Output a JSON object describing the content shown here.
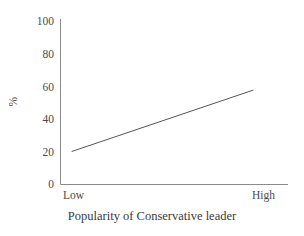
{
  "chart_data": {
    "type": "line",
    "title": "",
    "subtitle": "",
    "xlabel": "Popularity of Conservative leader",
    "ylabel": "%",
    "categories": [
      "Low",
      "High"
    ],
    "x": [
      0,
      1
    ],
    "values": [
      20,
      57
    ],
    "series": [
      {
        "name": "",
        "values": [
          20,
          57
        ]
      }
    ],
    "ylim": [
      0,
      100
    ],
    "yticks": [
      0,
      20,
      40,
      60,
      80,
      100
    ],
    "ytick_labels": [
      "0",
      "20",
      "40",
      "60",
      "80",
      "100"
    ],
    "xtick_labels": [
      "Low",
      "High"
    ],
    "grid": false,
    "legend": false,
    "legend_position": "none",
    "annotations": []
  },
  "style": {
    "line_color": "#555555",
    "axis_color": "#8a8a8a",
    "text_color": "#3a3a3a",
    "background": "#ffffff"
  }
}
